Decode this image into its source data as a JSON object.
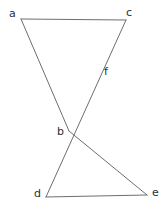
{
  "figure": {
    "background_color": "#ffffff",
    "stroke_color": "#6e6e6e",
    "label_color": "#2e2e2e",
    "stroke_width": 1,
    "canvas": {
      "width": 168,
      "height": 207
    },
    "points": [
      {
        "id": "a",
        "label": "a",
        "x": 21,
        "y": 19,
        "label_x": 9,
        "label_y": 8
      },
      {
        "id": "c",
        "label": "c",
        "x": 126,
        "y": 20,
        "label_x": 126,
        "label_y": 7
      },
      {
        "id": "f",
        "label": "f",
        "x": 97,
        "y": 77,
        "label_x": 104,
        "label_y": 66
      },
      {
        "id": "b",
        "label": "b",
        "x": 69,
        "y": 131,
        "label_x": 57,
        "label_y": 126
      },
      {
        "id": "d",
        "label": "d",
        "x": 46,
        "y": 197,
        "label_x": 34,
        "label_y": 188
      },
      {
        "id": "e",
        "label": "e",
        "x": 147,
        "y": 195,
        "label_x": 152,
        "label_y": 187
      }
    ],
    "segments": [
      {
        "id": "seg-a-c",
        "from": "a",
        "to": "c"
      },
      {
        "id": "seg-a-b",
        "from": "a",
        "to": "b"
      },
      {
        "id": "seg-c-d",
        "from": "c",
        "to": "d"
      },
      {
        "id": "seg-b-e",
        "from": "b",
        "to": "e"
      },
      {
        "id": "seg-d-e",
        "from": "d",
        "to": "e"
      }
    ]
  }
}
